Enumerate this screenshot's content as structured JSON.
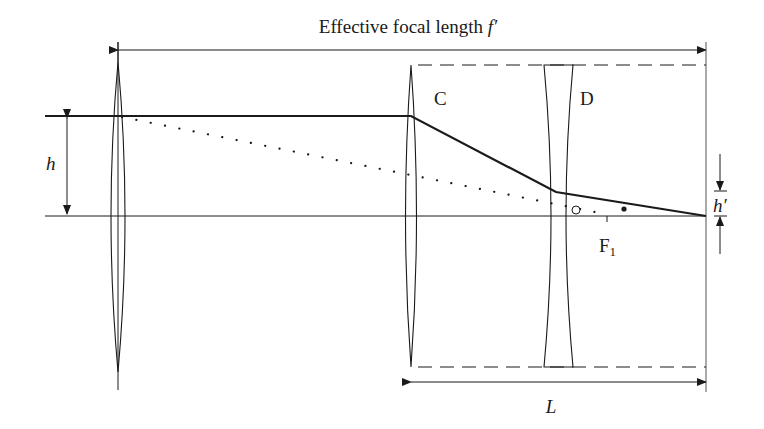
{
  "diagram": {
    "title": "Effective focal length",
    "title_symbol": "f′",
    "lens_c_label": "C",
    "lens_d_label": "D",
    "focal_point_label": "F",
    "focal_point_subscript": "1",
    "height_in_label": "h",
    "height_out_label": "h′",
    "length_label": "L",
    "colors": {
      "line": "#1a1a1a",
      "background": "#ffffff"
    }
  }
}
